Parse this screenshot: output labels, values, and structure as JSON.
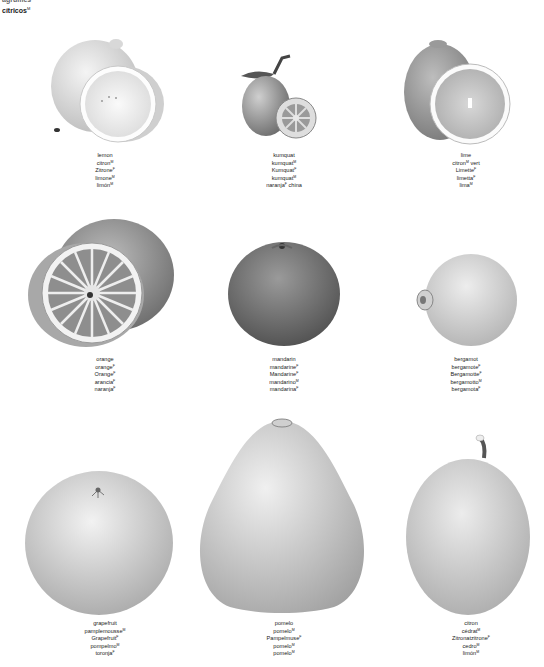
{
  "header": {
    "line1": "agrumes",
    "line2": "cítricos",
    "line2_gender": "M"
  },
  "fruits": [
    {
      "id": "lemon",
      "names": [
        {
          "t": "lemon",
          "g": ""
        },
        {
          "t": "citron",
          "g": "M"
        },
        {
          "t": "Zitrone",
          "g": "F"
        },
        {
          "t": "limone",
          "g": "M"
        },
        {
          "t": "limón",
          "g": "M"
        }
      ]
    },
    {
      "id": "kumquat",
      "names": [
        {
          "t": "kumquat",
          "g": ""
        },
        {
          "t": "kumquat",
          "g": "M"
        },
        {
          "t": "Kumquat",
          "g": "F"
        },
        {
          "t": "kumquat",
          "g": "M"
        },
        {
          "t": "naranja",
          "g": "F",
          "suffix": " china"
        }
      ]
    },
    {
      "id": "lime",
      "names": [
        {
          "t": "lime",
          "g": ""
        },
        {
          "t": "citron",
          "g": "M",
          "suffix": " vert"
        },
        {
          "t": "Limette",
          "g": "F"
        },
        {
          "t": "limetta",
          "g": "F"
        },
        {
          "t": "lima",
          "g": "M"
        }
      ]
    },
    {
      "id": "orange",
      "names": [
        {
          "t": "orange",
          "g": ""
        },
        {
          "t": "orange",
          "g": "F"
        },
        {
          "t": "Orange",
          "g": "F"
        },
        {
          "t": "arancia",
          "g": "F"
        },
        {
          "t": "naranja",
          "g": "F"
        }
      ]
    },
    {
      "id": "mandarin",
      "names": [
        {
          "t": "mandarin",
          "g": ""
        },
        {
          "t": "mandarine",
          "g": "F"
        },
        {
          "t": "Mandarine",
          "g": "F"
        },
        {
          "t": "mandarino",
          "g": "M"
        },
        {
          "t": "mandarina",
          "g": "F"
        }
      ]
    },
    {
      "id": "bergamot",
      "names": [
        {
          "t": "bergamot",
          "g": ""
        },
        {
          "t": "bergamote",
          "g": "F"
        },
        {
          "t": "Bergamotte",
          "g": "F"
        },
        {
          "t": "bergamotto",
          "g": "M"
        },
        {
          "t": "bergamota",
          "g": "F"
        }
      ]
    },
    {
      "id": "grapefruit",
      "names": [
        {
          "t": "grapefruit",
          "g": ""
        },
        {
          "t": "pamplemousse",
          "g": "M"
        },
        {
          "t": "Grapefruit",
          "g": "F"
        },
        {
          "t": "pompelmo",
          "g": "M"
        },
        {
          "t": "toronja",
          "g": "F"
        }
      ]
    },
    {
      "id": "pomelo",
      "names": [
        {
          "t": "pomelo",
          "g": ""
        },
        {
          "t": "pomelo",
          "g": "M"
        },
        {
          "t": "Pampelmuse",
          "g": "F"
        },
        {
          "t": "pomelo",
          "g": "M"
        },
        {
          "t": "pomelo",
          "g": "M"
        }
      ]
    },
    {
      "id": "citron",
      "names": [
        {
          "t": "citron",
          "g": ""
        },
        {
          "t": "cédrat",
          "g": "M"
        },
        {
          "t": "Zitronatzitrone",
          "g": "F"
        },
        {
          "t": "cedro",
          "g": "M"
        },
        {
          "t": "limón",
          "g": "M"
        }
      ]
    }
  ]
}
